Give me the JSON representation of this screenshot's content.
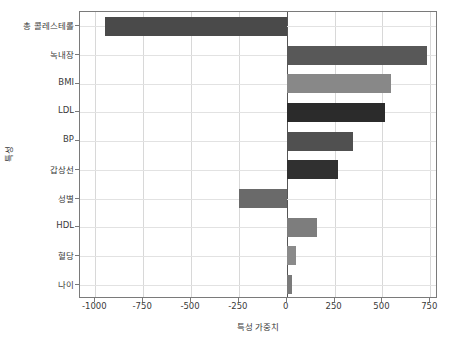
{
  "chart_data": {
    "type": "bar",
    "orientation": "horizontal",
    "title": "",
    "xlabel": "특성 가중치",
    "ylabel": "특성",
    "categories": [
      "총 콜레스테롤",
      "녹내장",
      "BMI",
      "LDL",
      "BP",
      "갑상선",
      "성별",
      "HDL",
      "혈당",
      "나이"
    ],
    "values": [
      -950,
      735,
      545,
      515,
      345,
      270,
      -250,
      160,
      48,
      30
    ],
    "bar_colors": [
      "#4a4a4a",
      "#585858",
      "#888888",
      "#2b2b2b",
      "#505050",
      "#303030",
      "#6a6a6a",
      "#7d7d7d",
      "#8a8a8a",
      "#7a7a7a"
    ],
    "xlim": [
      -1080,
      790
    ],
    "xticks": [
      -1000,
      -750,
      -500,
      -250,
      0,
      250,
      500,
      750
    ],
    "xticklabels": [
      "-1000",
      "-750",
      "-500",
      "-250",
      "0",
      "250",
      "500",
      "750"
    ],
    "grid": true,
    "grid_axis": "both",
    "legend": null,
    "axes_facecolor": "#ffffff",
    "frame_color": "#7a7a7a",
    "grid_color": "#d8d8d8"
  },
  "axis": {
    "y_title": "특성",
    "x_title": "특성 가중치"
  }
}
